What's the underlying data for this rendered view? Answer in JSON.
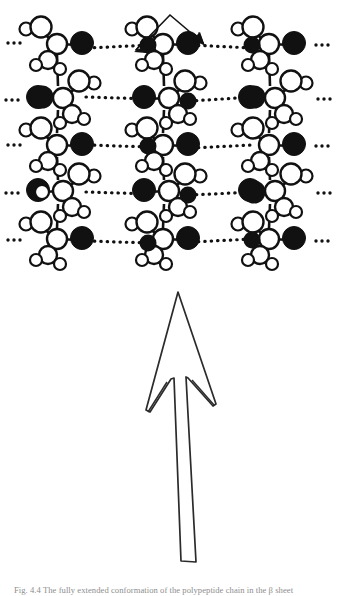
{
  "figure": {
    "background_color": "#ffffff",
    "line_color": "#1a1a1a",
    "filled_atom_color": "#111111",
    "open_atom_fill": "#ffffff",
    "width": 337,
    "height": 596
  },
  "molecular_sheet": {
    "description": "Three parallel vertical polypeptide chains drawn as space-filling circles, cross-linked by horizontal dotted hydrogen bonds",
    "chain_count": 3,
    "chain_x_centers": [
      60,
      166,
      272
    ],
    "row_count": 5,
    "row_y_centers": [
      45,
      99,
      146,
      192,
      240
    ],
    "ellipsis_label": "···",
    "left_ellipsis_x": 10,
    "right_ellipsis_x": 318,
    "hbond_style": "dotted",
    "hbond_rows": [
      {
        "y": 45,
        "segments": [
          [
            20,
            55
          ],
          [
            85,
            150
          ],
          [
            190,
            250
          ],
          [
            285,
            330
          ]
        ]
      },
      {
        "y": 99,
        "segments": [
          [
            15,
            48
          ],
          [
            82,
            152
          ],
          [
            188,
            252
          ],
          [
            290,
            332
          ]
        ]
      },
      {
        "y": 146,
        "segments": [
          [
            18,
            50
          ],
          [
            84,
            150
          ],
          [
            190,
            250
          ],
          [
            288,
            330
          ]
        ]
      },
      {
        "y": 192,
        "segments": [
          [
            15,
            48
          ],
          [
            82,
            152
          ],
          [
            188,
            252
          ],
          [
            290,
            332
          ]
        ]
      },
      {
        "y": 240,
        "segments": [
          [
            18,
            50
          ],
          [
            84,
            150
          ],
          [
            190,
            250
          ],
          [
            288,
            330
          ]
        ]
      }
    ]
  },
  "annotations": {
    "double_arrow": {
      "name": "double-headed-arrow",
      "description": "Double-headed arrow spanning between two hydrogen-bonded atoms at top of centre chain",
      "apex": [
        170,
        14
      ],
      "left_tip": [
        133,
        52
      ],
      "right_tip": [
        205,
        45
      ]
    },
    "direction_arrow": {
      "name": "chain-direction-arrow",
      "description": "Large hollow outlined arrow pointing upward indicating chain axis direction",
      "tip": [
        178,
        292
      ],
      "base_y": 562,
      "style": "outline"
    }
  },
  "caption": {
    "text": "Fig. 4.4 The fully extended conformation of the polypeptide chain in the β sheet",
    "clipped": true
  }
}
